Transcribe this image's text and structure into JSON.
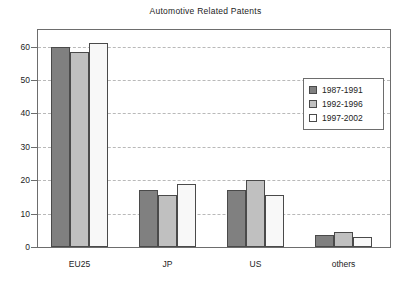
{
  "chart_data": {
    "type": "bar",
    "title": "Automotive Related Patents",
    "xlabel": "",
    "ylabel": "",
    "ylim": [
      0,
      65
    ],
    "yticks": [
      0,
      10,
      20,
      30,
      40,
      50,
      60
    ],
    "grid": true,
    "legend_position": "upper-right-inside",
    "categories": [
      "EU25",
      "JP",
      "US",
      "others"
    ],
    "series": [
      {
        "name": "1987-1991",
        "color": "#808080",
        "values": [
          60,
          17,
          17,
          3.5
        ]
      },
      {
        "name": "1992-1996",
        "color": "#c0c0c0",
        "values": [
          58.5,
          15.5,
          20,
          4.5
        ]
      },
      {
        "name": "1997-2002",
        "color": "#f8f8f8",
        "values": [
          61,
          19,
          15.5,
          3
        ]
      }
    ]
  },
  "legend": {
    "entries": [
      {
        "label": "1987-1991"
      },
      {
        "label": "1992-1996"
      },
      {
        "label": "1997-2002"
      }
    ]
  }
}
